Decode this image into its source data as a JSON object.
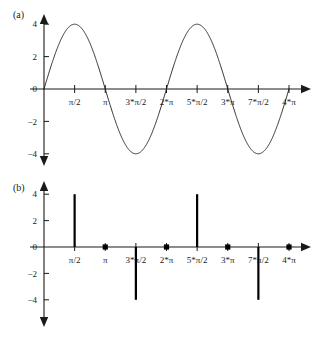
{
  "figure": {
    "background": "#ffffff",
    "ink_color": "#1a1a1a",
    "stem_color": "#000000"
  },
  "panels": [
    {
      "label": "(a)",
      "name": "continuous-sine-panel"
    },
    {
      "label": "(b)",
      "name": "discrete-stem-panel"
    }
  ],
  "axis": {
    "y_ticks": [
      {
        "value": 4,
        "label": "4"
      },
      {
        "value": 2,
        "label": "2"
      },
      {
        "value": 0,
        "label": "0"
      },
      {
        "value": -2,
        "label": "−2"
      },
      {
        "value": -4,
        "label": "−4"
      }
    ],
    "x_ticks": [
      {
        "value": 0.5,
        "label": "π/2"
      },
      {
        "value": 1.0,
        "label": "π"
      },
      {
        "value": 1.5,
        "label": "3*π/2"
      },
      {
        "value": 2.0,
        "label": "2*π"
      },
      {
        "value": 2.5,
        "label": "5*π/2"
      },
      {
        "value": 3.0,
        "label": "3*π"
      },
      {
        "value": 3.5,
        "label": "7*π/2"
      },
      {
        "value": 4.0,
        "label": "4*π"
      }
    ]
  },
  "chart_data": [
    {
      "type": "line",
      "name": "continuous-sine-wave",
      "title": "(a)",
      "xlabel": "",
      "ylabel": "",
      "expression": "4*sin(x)",
      "amplitude": 4,
      "xlim": [
        0,
        12.566370614359172
      ],
      "ylim": [
        -4,
        4
      ],
      "xlim_in_pi": [
        0,
        4
      ],
      "grid": false,
      "legend": false,
      "x_tick_labels": [
        "π/2",
        "π",
        "3*π/2",
        "2*π",
        "5*π/2",
        "3*π",
        "7*π/2",
        "4*π"
      ],
      "y_tick_labels": [
        "4",
        "2",
        "0",
        "−2",
        "−4"
      ],
      "key_points": [
        {
          "x_in_pi": 0.0,
          "y": 0
        },
        {
          "x_in_pi": 0.5,
          "y": 4
        },
        {
          "x_in_pi": 1.0,
          "y": 0
        },
        {
          "x_in_pi": 1.5,
          "y": -4
        },
        {
          "x_in_pi": 2.0,
          "y": 0
        },
        {
          "x_in_pi": 2.5,
          "y": 4
        },
        {
          "x_in_pi": 3.0,
          "y": 0
        },
        {
          "x_in_pi": 3.5,
          "y": -4
        },
        {
          "x_in_pi": 4.0,
          "y": 0
        }
      ]
    },
    {
      "type": "bar",
      "name": "discrete-stem-plot",
      "title": "(b)",
      "xlabel": "",
      "ylabel": "",
      "style": "stem",
      "sampling_interval_in_pi": 0.5,
      "xlim_in_pi": [
        0,
        4
      ],
      "ylim": [
        -4,
        4
      ],
      "grid": false,
      "legend": false,
      "categories": [
        "0",
        "π/2",
        "π",
        "3*π/2",
        "2*π",
        "5*π/2",
        "3*π",
        "7*π/2",
        "4*π"
      ],
      "x_in_pi": [
        0.0,
        0.5,
        1.0,
        1.5,
        2.0,
        2.5,
        3.0,
        3.5,
        4.0
      ],
      "values": [
        0,
        4,
        0,
        -4,
        0,
        4,
        0,
        -4,
        0
      ],
      "x_tick_labels": [
        "π/2",
        "π",
        "3*π/2",
        "2*π",
        "5*π/2",
        "3*π",
        "7*π/2",
        "4*π"
      ],
      "y_tick_labels": [
        "4",
        "2",
        "0",
        "−2",
        "−4"
      ]
    }
  ]
}
